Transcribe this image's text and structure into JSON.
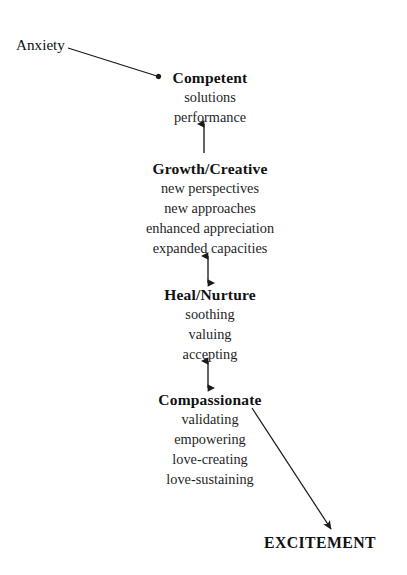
{
  "diagram": {
    "background_color": "#ffffff",
    "ink_color": "#1a1a1a",
    "labels": {
      "anxiety": "Anxiety",
      "excitement": "EXCITEMENT"
    },
    "nodes": [
      {
        "id": "competent",
        "heading": "Competent",
        "items": [
          "solutions",
          "performance"
        ]
      },
      {
        "id": "growth-creative",
        "heading": "Growth/Creative",
        "items": [
          "new perspectives",
          "new approaches",
          "enhanced appreciation",
          "expanded capacities"
        ]
      },
      {
        "id": "heal-nurture",
        "heading": "Heal/Nurture",
        "items": [
          "soothing",
          "valuing",
          "accepting"
        ]
      },
      {
        "id": "compassionate",
        "heading": "Compassionate",
        "items": [
          "validating",
          "empowering",
          "love-creating",
          "love-sustaining"
        ]
      }
    ],
    "connectors": [
      {
        "id": "anxiety-to-competent",
        "kind": "diagonal",
        "heads": "end-dot",
        "from": "Anxiety",
        "to": "Competent"
      },
      {
        "id": "growth-to-competent",
        "kind": "vertical",
        "heads": "single-up",
        "from": "Growth/Creative",
        "to": "Competent"
      },
      {
        "id": "growth-heal",
        "kind": "vertical",
        "heads": "double",
        "from": "Growth/Creative",
        "to": "Heal/Nurture"
      },
      {
        "id": "heal-compassionate",
        "kind": "vertical",
        "heads": "double",
        "from": "Heal/Nurture",
        "to": "Compassionate"
      },
      {
        "id": "compassionate-to-excitement",
        "kind": "diagonal",
        "heads": "single-end",
        "from": "Compassionate",
        "to": "EXCITEMENT"
      }
    ]
  }
}
